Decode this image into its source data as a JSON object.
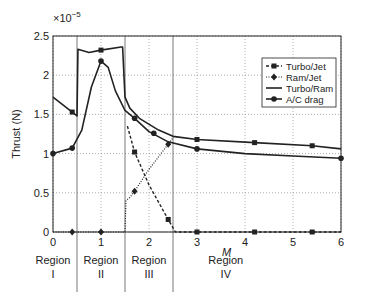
{
  "chart_data": {
    "type": "line",
    "title": "",
    "xlabel": "M",
    "ylabel": "Thrust (N)",
    "y_exponent_label": "×10",
    "y_exponent": "−5",
    "xlim": [
      0,
      6
    ],
    "ylim": [
      0,
      2.5
    ],
    "xticks": [
      "0",
      "1",
      "2",
      "3",
      "4",
      "5",
      "6"
    ],
    "yticks": [
      "0",
      "0.5",
      "1",
      "1.5",
      "2",
      "2.5"
    ],
    "grid": true,
    "legend_position": "upper right (inside)",
    "region_boundaries": [
      0.5,
      1.5,
      2.5
    ],
    "regions": [
      {
        "name": "Region",
        "numeral": "I",
        "x": 0.0
      },
      {
        "name": "Region",
        "numeral": "II",
        "x": 1.0
      },
      {
        "name": "Region",
        "numeral": "III",
        "x": 2.0
      },
      {
        "name": "Region",
        "numeral": "IV",
        "x": 3.6
      }
    ],
    "series": [
      {
        "name": "Turbo/Jet",
        "style": "dashed-square",
        "points": [
          [
            1.55,
            1.35
          ],
          [
            1.7,
            1.02
          ],
          [
            2.0,
            0.6
          ],
          [
            2.4,
            0.16
          ],
          [
            2.55,
            0.0
          ],
          [
            3.0,
            0.0
          ],
          [
            4.2,
            0.0
          ],
          [
            5.4,
            0.0
          ],
          [
            6.0,
            0.0
          ]
        ],
        "markers": [
          [
            1.7,
            1.02
          ],
          [
            2.4,
            0.16
          ],
          [
            3.0,
            0.0
          ],
          [
            4.2,
            0.0
          ],
          [
            5.4,
            0.0
          ]
        ]
      },
      {
        "name": "Ram/Jet",
        "style": "dotted-diamond",
        "points": [
          [
            0,
            0
          ],
          [
            0.4,
            0
          ],
          [
            1.0,
            0
          ],
          [
            1.5,
            0
          ],
          [
            1.52,
            0.4
          ],
          [
            1.6,
            0.44
          ],
          [
            1.7,
            0.52
          ],
          [
            2.0,
            0.8
          ],
          [
            2.4,
            1.12
          ],
          [
            2.5,
            1.2
          ]
        ],
        "markers": [
          [
            0.4,
            0
          ],
          [
            1.0,
            0
          ],
          [
            1.7,
            0.52
          ],
          [
            2.4,
            1.12
          ]
        ]
      },
      {
        "name": "Turbo/Ram",
        "style": "solid",
        "points": [
          [
            0,
            1.72
          ],
          [
            0.4,
            1.53
          ],
          [
            0.5,
            1.48
          ],
          [
            0.52,
            2.33
          ],
          [
            0.75,
            2.29
          ],
          [
            1.0,
            2.32
          ],
          [
            1.42,
            2.36
          ],
          [
            1.45,
            2.36
          ],
          [
            1.5,
            1.72
          ],
          [
            1.6,
            1.58
          ],
          [
            1.8,
            1.45
          ],
          [
            2.2,
            1.3
          ],
          [
            2.5,
            1.22
          ],
          [
            3.0,
            1.18
          ],
          [
            4.2,
            1.14
          ],
          [
            5.4,
            1.1
          ],
          [
            6.0,
            1.06
          ]
        ],
        "markers": [
          [
            0.4,
            1.53
          ],
          [
            1.0,
            2.32
          ],
          [
            3.0,
            1.18
          ],
          [
            4.2,
            1.14
          ],
          [
            5.4,
            1.1
          ]
        ]
      },
      {
        "name": "A/C drag",
        "style": "solid-circle",
        "points": [
          [
            0,
            1.0
          ],
          [
            0.4,
            1.07
          ],
          [
            0.6,
            1.3
          ],
          [
            0.8,
            1.85
          ],
          [
            1.0,
            2.18
          ],
          [
            1.15,
            2.1
          ],
          [
            1.3,
            1.8
          ],
          [
            1.5,
            1.55
          ],
          [
            1.7,
            1.45
          ],
          [
            2.0,
            1.28
          ],
          [
            2.4,
            1.15
          ],
          [
            3.0,
            1.06
          ],
          [
            4.0,
            1.0
          ],
          [
            5.0,
            0.97
          ],
          [
            6.0,
            0.94
          ]
        ],
        "markers": [
          [
            0,
            1.0
          ],
          [
            0.4,
            1.07
          ],
          [
            1.0,
            2.18
          ],
          [
            1.7,
            1.45
          ],
          [
            2.1,
            1.26
          ],
          [
            3.0,
            1.06
          ],
          [
            6.0,
            0.94
          ]
        ]
      }
    ]
  }
}
